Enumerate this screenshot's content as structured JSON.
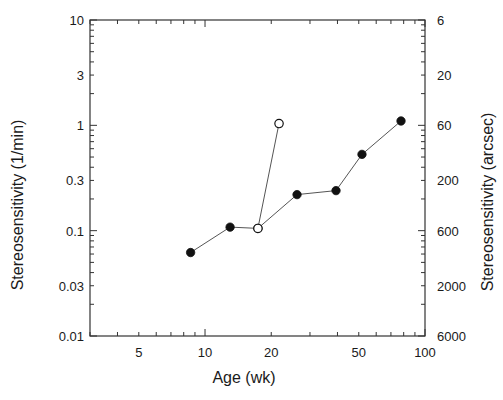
{
  "chart_data": {
    "type": "line",
    "title": "",
    "xlabel": "Age (wk)",
    "ylabel": "Stereosensitivity (1/min)",
    "ylabel_right": "Stereosensitivity (arcsec)",
    "xscale": "log",
    "yscale": "log",
    "xlim": [
      3,
      100
    ],
    "ylim": [
      0.01,
      10
    ],
    "grid": false,
    "legend": null,
    "x_ticks": [
      {
        "value": 5,
        "label": "5"
      },
      {
        "value": 10,
        "label": "10"
      },
      {
        "value": 20,
        "label": "20"
      },
      {
        "value": 50,
        "label": "50"
      },
      {
        "value": 100,
        "label": "100"
      }
    ],
    "y_ticks": [
      {
        "value": 10,
        "label": "10"
      },
      {
        "value": 3,
        "label": "3"
      },
      {
        "value": 1,
        "label": "1"
      },
      {
        "value": 0.3,
        "label": "0.3"
      },
      {
        "value": 0.1,
        "label": "0.1"
      },
      {
        "value": 0.03,
        "label": "0.03"
      },
      {
        "value": 0.01,
        "label": "0.01"
      }
    ],
    "y_right_ticks": [
      {
        "value": 10,
        "label": "6"
      },
      {
        "value": 3,
        "label": "20"
      },
      {
        "value": 1,
        "label": "60"
      },
      {
        "value": 0.3,
        "label": "200"
      },
      {
        "value": 0.1,
        "label": "600"
      },
      {
        "value": 0.03,
        "label": "2000"
      },
      {
        "value": 0.01,
        "label": "6000"
      }
    ],
    "series": [
      {
        "name": "filled",
        "marker": "filled-circle",
        "color": "#111111",
        "x": [
          8.6,
          13.0,
          17.4,
          26.2,
          39.4,
          51.7,
          77.8
        ],
        "y": [
          0.062,
          0.108,
          0.105,
          0.22,
          0.24,
          0.53,
          1.1
        ]
      },
      {
        "name": "open",
        "marker": "open-circle",
        "color": "#111111",
        "x": [
          17.4,
          21.7
        ],
        "y": [
          0.105,
          1.04
        ]
      }
    ]
  }
}
